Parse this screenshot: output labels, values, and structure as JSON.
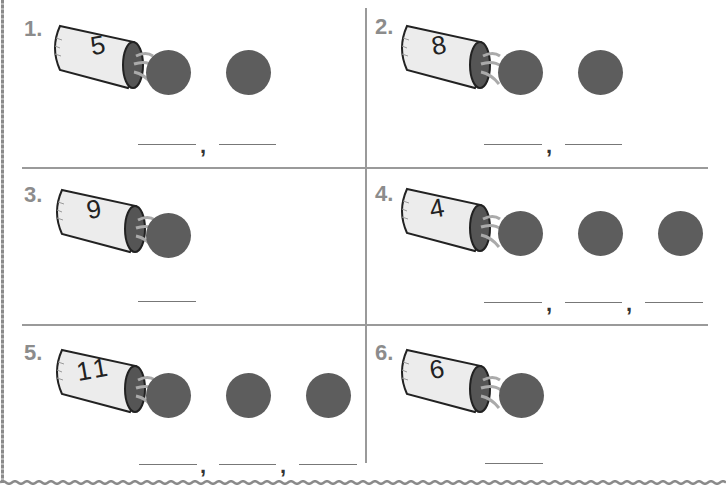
{
  "worksheet": {
    "problems": [
      {
        "label": "1.",
        "cup_number": "5",
        "circle_count": 2,
        "blank_count": 2
      },
      {
        "label": "2.",
        "cup_number": "8",
        "circle_count": 2,
        "blank_count": 2
      },
      {
        "label": "3.",
        "cup_number": "9",
        "circle_count": 1,
        "blank_count": 1
      },
      {
        "label": "4.",
        "cup_number": "4",
        "circle_count": 3,
        "blank_count": 3
      },
      {
        "label": "5.",
        "cup_number": "11",
        "circle_count": 3,
        "blank_count": 3
      },
      {
        "label": "6.",
        "cup_number": "6",
        "circle_count": 1,
        "blank_count": 1
      }
    ],
    "separator": ",",
    "colors": {
      "counter": "#5d5d5d",
      "label": "#8c8c8c",
      "divider": "#9a9a9a"
    }
  }
}
